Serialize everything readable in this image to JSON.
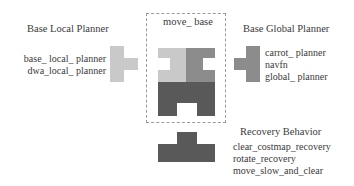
{
  "diagram": {
    "center": {
      "label": "move_ base"
    },
    "local_planner": {
      "title": "Base Local Planner",
      "items": [
        "base_ local_ planner",
        "dwa_local_ planner"
      ]
    },
    "global_planner": {
      "title": "Base Global Planner",
      "items": [
        "carrot_ planner",
        "navfn",
        "global_ planner"
      ]
    },
    "recovery": {
      "title": "Recovery Behavior",
      "items": [
        "clear_costmap_recovery",
        "rotate_recovery",
        "move_slow_and_clear"
      ]
    },
    "colors": {
      "light_piece": "#c9c9c9",
      "mid_piece": "#8c8c8c",
      "dark_piece": "#595959",
      "dashed_border": "#9a9a9a"
    }
  }
}
